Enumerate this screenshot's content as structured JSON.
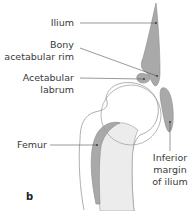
{
  "figure": {
    "panel_label": "b",
    "labels": {
      "ilium": "Ilium",
      "bony_rim_line1": "Bony",
      "bony_rim_line2": "acetabular rim",
      "labrum_line1": "Acetabular",
      "labrum_line2": "labrum",
      "femur": "Femur",
      "inferior_line1": "Inferior",
      "inferior_line2": "margin",
      "inferior_line3": "of ilium"
    },
    "colors": {
      "bone_fill": "#a9a9a9",
      "bone_stroke": "#8a8a8a",
      "soft_fill": "#ececec",
      "outline": "#9a9a9a",
      "leader": "#555555",
      "text": "#3a3a3a"
    }
  }
}
